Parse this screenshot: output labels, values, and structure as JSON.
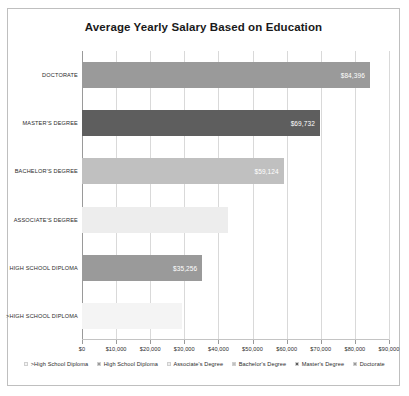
{
  "chart_data": {
    "type": "bar",
    "orientation": "horizontal",
    "title": "Average Yearly Salary Based on Education",
    "xlabel": "",
    "ylabel": "",
    "categories": [
      "DOCTORATE",
      "MASTER'S DEGREE",
      "BACHELOR'S DEGREE",
      "ASSOCIATE'S DEGREE",
      "HIGH SCHOOL DIPLOMA",
      ">HIGH SCHOOL DIPLOMA"
    ],
    "values": [
      84396,
      69732,
      59124,
      42900,
      35256,
      29400
    ],
    "data_labels": [
      "$84,396",
      "$69,732",
      "$59,124",
      "",
      "$35,256",
      ""
    ],
    "bar_colors": [
      "#9a9a9a",
      "#5e5e5e",
      "#c0c0c0",
      "#ededed",
      "#9a9a9a",
      "#f4f4f4"
    ],
    "xlim": [
      0,
      90000
    ],
    "xticks": [
      0,
      10000,
      20000,
      30000,
      40000,
      50000,
      60000,
      70000,
      80000,
      90000
    ],
    "xtick_labels": [
      "$0",
      "$10,000",
      "$20,000",
      "$30,000",
      "$40,000",
      "$50,000",
      "$60,000",
      "$70,000",
      "$80,000",
      "$90,000"
    ],
    "grid": true,
    "grid_axis": "x",
    "legend_position": "bottom",
    "legend": [
      {
        "label": ">High School Diploma",
        "color": "#f4f4f4"
      },
      {
        "label": "High School Diploma",
        "color": "#9a9a9a"
      },
      {
        "label": "Associate's Degree",
        "color": "#ededed"
      },
      {
        "label": "Bachelor's Degree",
        "color": "#c0c0c0"
      },
      {
        "label": "Master's Degree",
        "color": "#5e5e5e"
      },
      {
        "label": "Doctorate",
        "color": "#9a9a9a"
      }
    ]
  }
}
